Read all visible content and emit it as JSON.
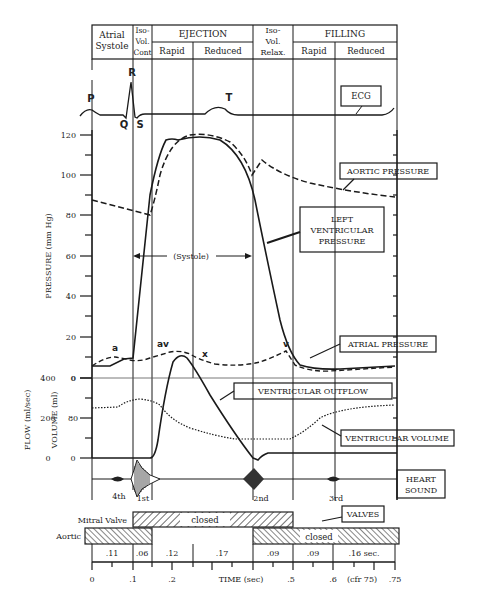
{
  "header": {
    "phases": [
      {
        "label_lines": [
          "Atrial",
          "Systole"
        ]
      },
      {
        "label_lines": [
          "Iso-",
          "Vol.",
          "Cont"
        ]
      },
      {
        "label": "EJECTION",
        "sub": [
          "Rapid",
          "Reduced"
        ]
      },
      {
        "label_lines": [
          "Iso-",
          "Vol.",
          "Relax."
        ]
      },
      {
        "label": "FILLING",
        "sub": [
          "Rapid",
          "Reduced"
        ]
      }
    ]
  },
  "ecg": {
    "label": "ECG",
    "waves": [
      "P",
      "Q",
      "R",
      "S",
      "T"
    ]
  },
  "pressure_axis": {
    "title": "PRESSURE (mm Hg)",
    "ticks": [
      "120",
      "100",
      "80",
      "60",
      "40",
      "20",
      "0"
    ]
  },
  "flow_axis": {
    "title_flow": "FLOW (ml/sec)",
    "title_volume": "VOLUME (ml)",
    "flow_ticks": [
      "400",
      "200",
      "0"
    ],
    "volume_ticks": [
      "0",
      "80",
      "0"
    ]
  },
  "labels": {
    "aortic_pressure": "AORTIC PRESSURE",
    "lv_pressure": [
      "LEFT",
      "VENTRICULAR",
      "PRESSURE"
    ],
    "systole": "(Systole)",
    "atrial_pressure": "ATRIAL PRESSURE",
    "atrial_waves": [
      "a",
      "av",
      "x",
      "v"
    ],
    "ventricular_outflow": "VENTRICULAR OUTFLOW",
    "ventricular_volume": "VENTRICULAR VOLUME",
    "heart_sound": [
      "HEART",
      "SOUND"
    ],
    "sounds": [
      "4th",
      "1st",
      "2nd",
      "3rd"
    ],
    "valves": "VALVES",
    "mitral_valve": "Mitral Valve",
    "aortic": "Aortic",
    "closed": "closed"
  },
  "durations": [
    ".11",
    ".06",
    ".12",
    ".17",
    ".09",
    ".09",
    ".16 sec."
  ],
  "time_axis": {
    "title": "TIME (sec)",
    "ticks": [
      "0",
      ".1",
      ".2",
      ".5",
      ".6",
      ".75"
    ],
    "note": "(cfr 75)"
  }
}
